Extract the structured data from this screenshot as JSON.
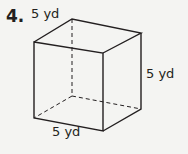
{
  "problem": {
    "number": "4.",
    "figure": "cube",
    "labels": {
      "top_depth": "5 yd",
      "right_height": "5 yd",
      "bottom_width": "5 yd"
    }
  }
}
